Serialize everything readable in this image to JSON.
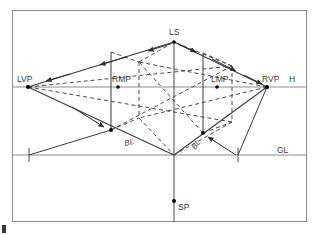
{
  "figure": {
    "type": "two-point-perspective-construction-diagram",
    "canvas": {
      "width": 320,
      "height": 235,
      "background": "#ffffff"
    },
    "border": {
      "x": 12,
      "y": 10,
      "width": 295,
      "height": 212,
      "color": "#888888"
    },
    "colors": {
      "solid_line": "#3a3a3a",
      "dashed_line": "#4a4a4a",
      "thin_line": "#8a8a8a",
      "label_text": "#3c3c3c",
      "point": "#000000"
    },
    "lines": {
      "horizon": {
        "name": "horizon-line",
        "y": 87,
        "x1": 13,
        "x2": 306,
        "label": "H"
      },
      "ground": {
        "name": "ground-line",
        "y": 155,
        "x1": 13,
        "x2": 306,
        "label": "GL"
      }
    },
    "points": {
      "LVP": {
        "label": "LVP",
        "x": 28,
        "y": 87,
        "label_x": 17,
        "label_y": 82
      },
      "RVP": {
        "label": "RVP",
        "x": 267,
        "y": 87,
        "label_x": 262,
        "label_y": 82
      },
      "RMP": {
        "label": "RMP",
        "x": 118,
        "y": 87,
        "label_x": 113,
        "label_y": 82
      },
      "LMP": {
        "label": "LMP",
        "x": 217,
        "y": 87,
        "label_x": 212,
        "label_y": 82
      },
      "LS": {
        "label": "LS",
        "x": 174,
        "y": 42,
        "label_x": 170,
        "label_y": 34
      },
      "SP": {
        "label": "SP",
        "x": 174,
        "y": 201,
        "label_x": 178,
        "label_y": 210
      },
      "H": {
        "label": "H",
        "label_x": 289,
        "label_y": 82
      },
      "GL": {
        "label": "GL",
        "label_x": 277,
        "label_y": 152
      },
      "BL_left": {
        "label": "BL",
        "label_x": 125,
        "label_y": 145,
        "rotate": -14
      },
      "BL_right": {
        "label": "BL",
        "label_x": 196,
        "label_y": 148,
        "rotate": -52
      }
    },
    "box": {
      "apex_top": {
        "x": 174,
        "y": 42
      },
      "front_bottom": {
        "x": 174,
        "y": 155
      },
      "left_vertical": {
        "x": 111,
        "y_top": 52,
        "y_bottom": 130
      },
      "right_vertical": {
        "x": 203,
        "y_top": 53,
        "y_bottom": 133
      },
      "center_vertical": {
        "x": 174,
        "y_top": 42,
        "y_bottom": 222
      },
      "hidden_corner_left": {
        "x": 139,
        "y_top": 62,
        "y_bottom": 118
      },
      "hidden_corner_right": {
        "x": 232,
        "y_top": 66,
        "y_bottom": 122
      }
    },
    "ticks": [
      {
        "name": "ground-tick-left",
        "x": 29,
        "y": 155,
        "half_height": 7
      },
      {
        "name": "ground-tick-right",
        "x": 238,
        "y": 155,
        "half_height": 7
      }
    ],
    "arrowheads_count": 10,
    "corner_mark": {
      "x": 2,
      "y": 225,
      "width": 4,
      "height": 8
    }
  }
}
